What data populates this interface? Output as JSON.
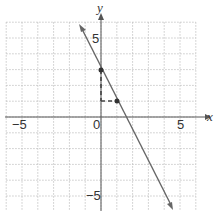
{
  "chart_data": {
    "type": "line",
    "title": "",
    "xlabel": "x",
    "ylabel": "y",
    "xlim": [
      -6,
      6
    ],
    "ylim": [
      -6,
      6
    ],
    "grid": true,
    "x_tick_labels": [
      "-5",
      "0",
      "5"
    ],
    "y_tick_labels": [
      "5",
      "-5"
    ],
    "series": [
      {
        "name": "line",
        "equation": "y = -2x + 3",
        "slope": -2,
        "intercept": 3,
        "x": [
          -1.5,
          4.5
        ],
        "y": [
          6,
          -6
        ],
        "arrows": "both"
      }
    ],
    "points": [
      {
        "x": 0,
        "y": 3
      },
      {
        "x": 1,
        "y": 1
      }
    ],
    "annotations": [
      {
        "type": "dashed-rise",
        "from": [
          0,
          3
        ],
        "to": [
          0,
          1
        ]
      },
      {
        "type": "dashed-run",
        "from": [
          0,
          1
        ],
        "to": [
          1,
          1
        ]
      }
    ]
  },
  "labels": {
    "x": "x",
    "y": "y",
    "neg5": "−5",
    "zero": "0",
    "pos5": "5",
    "yneg5": "−5",
    "ypos5": "5"
  }
}
